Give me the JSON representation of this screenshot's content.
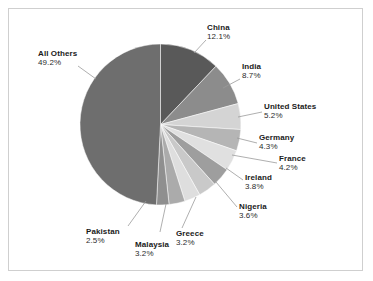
{
  "chart_data": {
    "type": "pie",
    "title": "",
    "subtitle": "",
    "xlabel": "",
    "ylabel": "",
    "legend_position": "none",
    "grid": false,
    "value_unit": "percent",
    "start_angle_deg": 0,
    "direction": "clockwise",
    "categories": [
      "China",
      "India",
      "United States",
      "Germany",
      "France",
      "Ireland",
      "Nigeria",
      "Greece",
      "Malaysia",
      "Pakistan",
      "All Others"
    ],
    "values": [
      12.1,
      8.7,
      5.2,
      4.3,
      4.2,
      3.8,
      3.6,
      3.2,
      3.2,
      2.5,
      49.2
    ],
    "labels": [
      "12.1%",
      "8.7%",
      "5.2%",
      "4.3%",
      "4.2%",
      "3.8%",
      "3.6%",
      "3.2%",
      "3.2%",
      "2.5%",
      "49.2%"
    ],
    "colors": [
      "#595959",
      "#8c8c8c",
      "#d4d4d4",
      "#b5b5b5",
      "#e0e0e0",
      "#9e9e9e",
      "#c9c9c9",
      "#dedede",
      "#ababab",
      "#8f8f8f",
      "#6e6e6e"
    ],
    "slices": [
      {
        "name": "China",
        "value": 12.1,
        "label": "12.1%",
        "color": "#595959"
      },
      {
        "name": "India",
        "value": 8.7,
        "label": "8.7%",
        "color": "#8c8c8c"
      },
      {
        "name": "United States",
        "value": 5.2,
        "label": "5.2%",
        "color": "#d4d4d4"
      },
      {
        "name": "Germany",
        "value": 4.3,
        "label": "4.3%",
        "color": "#b5b5b5"
      },
      {
        "name": "France",
        "value": 4.2,
        "label": "4.2%",
        "color": "#e0e0e0"
      },
      {
        "name": "Ireland",
        "value": 3.8,
        "label": "3.8%",
        "color": "#9e9e9e"
      },
      {
        "name": "Nigeria",
        "value": 3.6,
        "label": "3.6%",
        "color": "#c9c9c9"
      },
      {
        "name": "Greece",
        "value": 3.2,
        "label": "3.2%",
        "color": "#dedede"
      },
      {
        "name": "Malaysia",
        "value": 3.2,
        "label": "3.2%",
        "color": "#ababab"
      },
      {
        "name": "Pakistan",
        "value": 2.5,
        "label": "2.5%",
        "color": "#8f8f8f"
      },
      {
        "name": "All Others",
        "value": 49.2,
        "label": "49.2%",
        "color": "#6e6e6e"
      }
    ]
  },
  "frame": {
    "border_color": "#cfcfcf",
    "background": "#ffffff"
  },
  "callouts": {
    "china": {
      "name": "China",
      "pct": "12.1%"
    },
    "india": {
      "name": "India",
      "pct": "8.7%"
    },
    "united_states": {
      "name": "United States",
      "pct": "5.2%"
    },
    "germany": {
      "name": "Germany",
      "pct": "4.3%"
    },
    "france": {
      "name": "France",
      "pct": "4.2%"
    },
    "ireland": {
      "name": "Ireland",
      "pct": "3.8%"
    },
    "nigeria": {
      "name": "Nigeria",
      "pct": "3.6%"
    },
    "greece": {
      "name": "Greece",
      "pct": "3.2%"
    },
    "malaysia": {
      "name": "Malaysia",
      "pct": "3.2%"
    },
    "pakistan": {
      "name": "Pakistan",
      "pct": "2.5%"
    },
    "all_others": {
      "name": "All Others",
      "pct": "49.2%"
    }
  }
}
